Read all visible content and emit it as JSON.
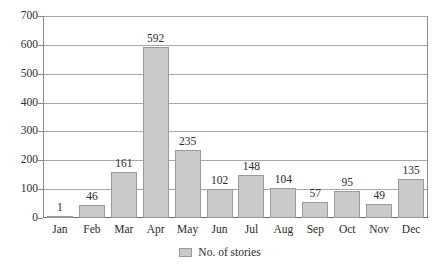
{
  "chart_data": {
    "type": "bar",
    "title": "",
    "xlabel": "",
    "ylabel": "",
    "categories": [
      "Jan",
      "Feb",
      "Mar",
      "Apr",
      "May",
      "Jun",
      "Jul",
      "Aug",
      "Sep",
      "Oct",
      "Nov",
      "Dec"
    ],
    "values": [
      1,
      46,
      161,
      592,
      235,
      102,
      148,
      104,
      57,
      95,
      49,
      135
    ],
    "series": [
      {
        "name": "No. of stories",
        "values": [
          1,
          46,
          161,
          592,
          235,
          102,
          148,
          104,
          57,
          95,
          49,
          135
        ]
      }
    ],
    "ylim": [
      0,
      700
    ],
    "y_ticks": [
      0,
      100,
      200,
      300,
      400,
      500,
      600,
      700
    ],
    "y_tick_labels": [
      "0",
      "100",
      "200",
      "300",
      "400",
      "500",
      "600",
      "700"
    ],
    "grid": true,
    "legend": {
      "position": "bottom-center",
      "entries": [
        {
          "label": "No. of stories",
          "color": "#cacaca"
        }
      ]
    },
    "data_labels": [
      "1",
      "46",
      "161",
      "592",
      "235",
      "102",
      "148",
      "104",
      "57",
      "95",
      "49",
      "135"
    ],
    "colors": {
      "bar_fill": "#cacaca",
      "bar_border": "#9a9a9a",
      "gridline": "#a8a8a8",
      "axis": "#8c8c8c",
      "text": "#2b2b2b",
      "background": "#ffffff"
    }
  }
}
